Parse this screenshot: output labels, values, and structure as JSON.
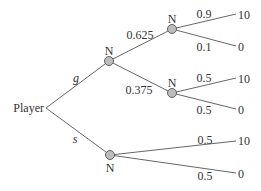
{
  "diagram": {
    "type": "game-tree",
    "root": {
      "label": "Player",
      "actions": [
        {
          "label": "g",
          "node_label": "N",
          "branches": [
            {
              "prob": "0.625",
              "node_label": "N",
              "outcomes": [
                {
                  "prob": "0.9",
                  "payoff": "10"
                },
                {
                  "prob": "0.1",
                  "payoff": "0"
                }
              ]
            },
            {
              "prob": "0.375",
              "node_label": "N",
              "outcomes": [
                {
                  "prob": "0.5",
                  "payoff": "10"
                },
                {
                  "prob": "0.5",
                  "payoff": "0"
                }
              ]
            }
          ]
        },
        {
          "label": "s",
          "node_label": "N",
          "outcomes": [
            {
              "prob": "0.5",
              "payoff": "10"
            },
            {
              "prob": "0.5",
              "payoff": "0"
            }
          ]
        }
      ]
    },
    "colors": {
      "line": "#555555",
      "node_fill": "#bdbdbd",
      "text": "#333333",
      "background": "#ffffff"
    }
  }
}
